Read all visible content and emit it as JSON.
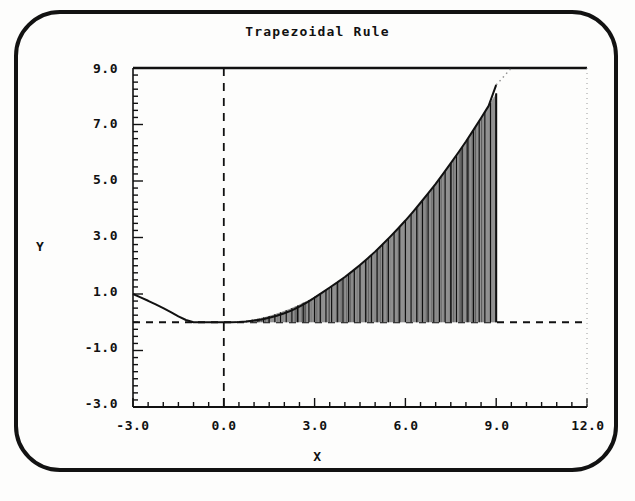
{
  "window": {
    "device": "crt-monitor-photo",
    "bezel_color": "#121212",
    "screen_color": "#fdfdfc"
  },
  "chart_data": {
    "type": "area",
    "title": "Trapezoidal Rule",
    "xlabel": "X",
    "ylabel": "Y",
    "xlim": [
      -3.0,
      12.0
    ],
    "ylim": [
      -3.0,
      9.0
    ],
    "grid": false,
    "legend": null,
    "ink_color": "#111111",
    "xticks": [
      "-3.0",
      "0.0",
      "3.0",
      "6.0",
      "9.0",
      "12.0"
    ],
    "xtick_values": [
      -3.0,
      0.0,
      3.0,
      6.0,
      9.0,
      12.0
    ],
    "yticks": [
      "9.0",
      "7.0",
      "5.0",
      "3.0",
      "1.0",
      "-1.0",
      "-3.0"
    ],
    "ytick_values": [
      9.0,
      7.0,
      5.0,
      3.0,
      1.0,
      -1.0,
      -3.0
    ],
    "x_minor_tick_step": 0.5,
    "y_minor_tick_step": 0.25,
    "axes": {
      "x_axis_dashed_line_y": 0.0,
      "y_axis_dashed_line_x": 0.0,
      "right_dotted_line_x": 12.0,
      "top_solid_line_y": 9.0
    },
    "integration": {
      "lower_limit": 0.0,
      "upper_limit": 9.0,
      "n_trapezoids": 48,
      "shaded": true
    },
    "curve_description": "f(x) = 0.1*x^2 for x >= 0, decreasing branch from y=1.0 at x=-3 to y=0 near x=-1.3, flat at 0 between -1.3 and 0.8",
    "series": [
      {
        "name": "f(x)",
        "x": [
          -3.0,
          -2.75,
          -2.5,
          -2.25,
          -2.0,
          -1.75,
          -1.5,
          -1.25,
          -1.0,
          -0.75,
          -0.5,
          -0.25,
          0.0,
          0.25,
          0.5,
          0.75,
          1.0,
          1.25,
          1.5,
          1.75,
          2.0,
          2.25,
          2.5,
          2.75,
          3.0,
          3.25,
          3.5,
          3.75,
          4.0,
          4.25,
          4.5,
          4.75,
          5.0,
          5.25,
          5.5,
          5.75,
          6.0,
          6.25,
          6.5,
          6.75,
          7.0,
          7.25,
          7.5,
          7.75,
          8.0,
          8.25,
          8.5,
          8.75,
          9.0,
          9.25,
          9.5,
          9.75,
          10.0
        ],
        "y": [
          1.0,
          0.88,
          0.76,
          0.63,
          0.5,
          0.36,
          0.21,
          0.08,
          0.0,
          0.0,
          0.0,
          0.0,
          0.0,
          0.0,
          0.01,
          0.03,
          0.06,
          0.1,
          0.16,
          0.23,
          0.32,
          0.42,
          0.55,
          0.7,
          0.87,
          1.05,
          1.23,
          1.41,
          1.6,
          1.81,
          2.03,
          2.26,
          2.5,
          2.76,
          3.03,
          3.31,
          3.6,
          3.91,
          4.23,
          4.56,
          4.9,
          5.26,
          5.63,
          6.01,
          6.4,
          6.81,
          7.23,
          7.66,
          8.4,
          8.7,
          9.0,
          9.3,
          9.6
        ]
      }
    ],
    "trapezoid_x_edges": [
      0.0,
      0.1875,
      0.375,
      0.5625,
      0.75,
      0.9375,
      1.125,
      1.3125,
      1.5,
      1.6875,
      1.875,
      2.0625,
      2.25,
      2.4375,
      2.625,
      2.8125,
      3.0,
      3.1875,
      3.375,
      3.5625,
      3.75,
      3.9375,
      4.125,
      4.3125,
      4.5,
      4.6875,
      4.875,
      5.0625,
      5.25,
      5.4375,
      5.625,
      5.8125,
      6.0,
      6.1875,
      6.375,
      6.5625,
      6.75,
      6.9375,
      7.125,
      7.3125,
      7.5,
      7.6875,
      7.875,
      8.0625,
      8.25,
      8.4375,
      8.625,
      8.8125,
      9.0
    ]
  }
}
